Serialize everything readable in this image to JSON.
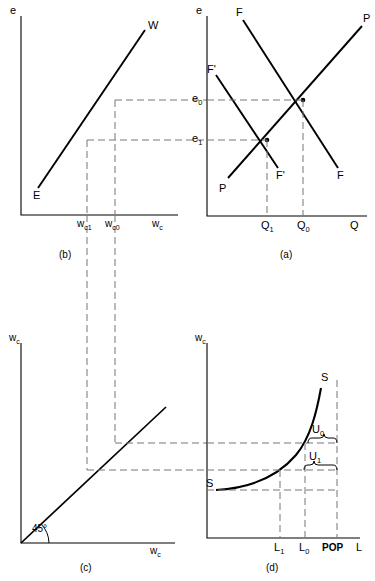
{
  "figure": {
    "stroke_color": "#000000",
    "dash_color": "#777777",
    "background": "#ffffff"
  },
  "panels": {
    "a": {
      "caption": "(a)",
      "y_axis_label": "e",
      "x_axis_label": "Q",
      "y_ticks": [
        "e0",
        "e1"
      ],
      "y_tick_labels": [
        {
          "base": "e",
          "sub": "0"
        },
        {
          "base": "e",
          "sub": "1"
        }
      ],
      "x_ticks": [
        "Q1",
        "Q0"
      ],
      "x_tick_labels": [
        {
          "base": "Q",
          "sub": "1"
        },
        {
          "base": "Q",
          "sub": "0"
        }
      ],
      "curves": [
        {
          "name": "F",
          "label_top": "F",
          "label_bottom": "F",
          "kind": "downward"
        },
        {
          "name": "F-prime",
          "label_top": "F'",
          "label_bottom": "F'",
          "kind": "downward-shifted"
        },
        {
          "name": "P",
          "label_top": "P",
          "label_bottom": "P",
          "kind": "upward"
        }
      ]
    },
    "b": {
      "caption": "(b)",
      "y_axis_label": "e",
      "x_axis_label": "wc",
      "x_axis_label_parts": {
        "base": "w",
        "sub": "c"
      },
      "x_ticks": [
        "wc1",
        "wc0"
      ],
      "x_tick_labels": [
        {
          "base": "w",
          "sub": "c1"
        },
        {
          "base": "w",
          "sub": "c0"
        }
      ],
      "curves": [
        {
          "name": "EW",
          "label_start": "E",
          "label_end": "W",
          "kind": "upward-line"
        }
      ]
    },
    "c": {
      "caption": "(c)",
      "y_axis_label": "wc",
      "y_axis_label_parts": {
        "base": "w",
        "sub": "c"
      },
      "x_axis_label": "wc",
      "x_axis_label_parts": {
        "base": "w",
        "sub": "c"
      },
      "angle_label": "45°",
      "curves": [
        {
          "name": "forty-five-degree-line",
          "kind": "diagonal"
        }
      ]
    },
    "d": {
      "caption": "(d)",
      "y_axis_label": "wc",
      "y_axis_label_parts": {
        "base": "w",
        "sub": "c"
      },
      "x_axis_label": "L",
      "x_ticks": [
        "L1",
        "L0",
        "POP"
      ],
      "x_tick_labels": [
        {
          "base": "L",
          "sub": "1"
        },
        {
          "base": "L",
          "sub": "0"
        },
        {
          "base": "POP",
          "sub": ""
        }
      ],
      "curves": [
        {
          "name": "S",
          "label_start": "S",
          "label_end": "S",
          "kind": "convex-rising"
        }
      ],
      "brackets": [
        {
          "name": "U0",
          "base": "U",
          "sub": "0"
        },
        {
          "name": "U1",
          "base": "U",
          "sub": "1"
        }
      ]
    }
  }
}
